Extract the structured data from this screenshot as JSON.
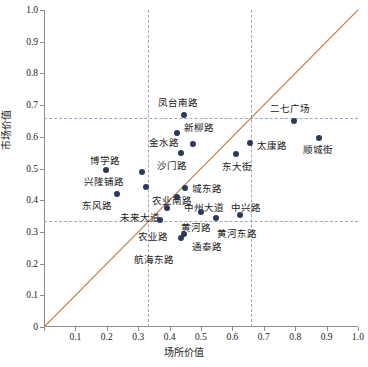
{
  "chart_data": {
    "type": "scatter",
    "title": "",
    "xlabel": "场所价值",
    "ylabel": "市场价值",
    "xlim": [
      0,
      1.0
    ],
    "ylim": [
      0,
      1.0
    ],
    "xticks": [
      "0",
      "0.1",
      "0.2",
      "0.3",
      "0.4",
      "0.5",
      "0.6",
      "0.7",
      "0.8",
      "0.9",
      "1.0"
    ],
    "yticks": [
      "0",
      "0.1",
      "0.2",
      "0.3",
      "0.4",
      "0.5",
      "0.6",
      "0.7",
      "0.8",
      "0.9",
      "1.0"
    ],
    "grid": false,
    "legend": "none",
    "point_color": "#2b3a5c",
    "diagonal_line_color": "#c07a43",
    "reference_line_color": "#9aa7bd",
    "reference_lines": {
      "horizontal": [
        0.66,
        0.335
      ],
      "vertical": [
        0.33,
        0.66
      ]
    },
    "annotations": [
      {
        "name": "凤台南路",
        "x": 0.445,
        "y": 0.668,
        "lx": -26,
        "ly": -16
      },
      {
        "name": "二七广场",
        "x": 0.795,
        "y": 0.649,
        "lx": -24,
        "ly": -16
      },
      {
        "name": "新柳路",
        "x": 0.425,
        "y": 0.613,
        "lx": 7,
        "ly": -9
      },
      {
        "name": "金水路",
        "x": 0.475,
        "y": 0.578,
        "lx": -44,
        "ly": -5
      },
      {
        "name": "太康路",
        "x": 0.655,
        "y": 0.58,
        "lx": 7,
        "ly": -1
      },
      {
        "name": "顺城街",
        "x": 0.875,
        "y": 0.595,
        "lx": -16,
        "ly": 8
      },
      {
        "name": "沙门路",
        "x": 0.435,
        "y": 0.549,
        "lx": -24,
        "ly": 9
      },
      {
        "name": "东大街",
        "x": 0.612,
        "y": 0.545,
        "lx": -14,
        "ly": 9
      },
      {
        "name": "博学路",
        "x": 0.198,
        "y": 0.496,
        "lx": -16,
        "ly": -13
      },
      {
        "name": "兴隆铺路",
        "x": 0.312,
        "y": 0.488,
        "lx": -58,
        "ly": 6
      },
      {
        "name": "农业南路",
        "x": 0.325,
        "y": 0.441,
        "lx": 6,
        "ly": 10
      },
      {
        "name": "城东路",
        "x": 0.448,
        "y": 0.437,
        "lx": 7,
        "ly": -3
      },
      {
        "name": "东风路",
        "x": 0.233,
        "y": 0.42,
        "lx": -35,
        "ly": 8
      },
      {
        "name": "中州大道",
        "x": 0.423,
        "y": 0.411,
        "lx": 7,
        "ly": 7
      },
      {
        "name": "未来大道",
        "x": 0.393,
        "y": 0.376,
        "lx": -47,
        "ly": 6
      },
      {
        "name": "中兴路",
        "x": 0.623,
        "y": 0.354,
        "lx": -9,
        "ly": -11
      },
      {
        "name": "黄河路",
        "x": 0.5,
        "y": 0.362,
        "lx": -20,
        "ly": 12
      },
      {
        "name": "黄河东路",
        "x": 0.548,
        "y": 0.345,
        "lx": 1,
        "ly": 12
      },
      {
        "name": "农业路",
        "x": 0.368,
        "y": 0.338,
        "lx": -22,
        "ly": 13
      },
      {
        "name": "通泰路",
        "x": 0.447,
        "y": 0.294,
        "lx": 8,
        "ly": 9
      },
      {
        "name": "航海东路",
        "x": 0.437,
        "y": 0.281,
        "lx": -47,
        "ly": 18
      }
    ]
  }
}
